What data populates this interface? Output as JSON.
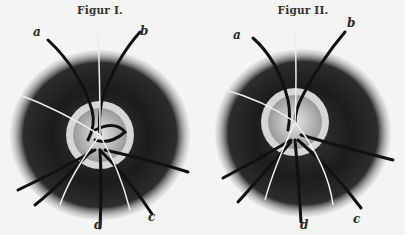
{
  "figures": [
    {
      "title": "Figur I.",
      "labels": {
        "a": "a",
        "b": "b",
        "c": "c",
        "d": "d"
      }
    },
    {
      "title": "Figur II.",
      "labels": {
        "a": "a",
        "b": "b",
        "c": "c",
        "d": "d"
      }
    }
  ],
  "colors": {
    "background": "#f4f4f2",
    "fundus_dark": "#1e1e1e",
    "disc_ring": "#d8d8d8",
    "vessel": "#111111"
  }
}
